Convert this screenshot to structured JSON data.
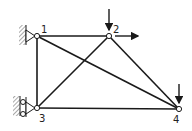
{
  "diagram": {
    "nodes": [
      {
        "id": "1",
        "label": "1",
        "x": 37,
        "y": 36,
        "lx": 41,
        "ly": 33,
        "support": "pin-wall"
      },
      {
        "id": "2",
        "label": "2",
        "x": 109,
        "y": 36,
        "lx": 113,
        "ly": 33,
        "support": "none"
      },
      {
        "id": "3",
        "label": "3",
        "x": 37,
        "y": 108,
        "lx": 39,
        "ly": 122,
        "support": "roller-wall"
      },
      {
        "id": "4",
        "label": "4",
        "x": 179,
        "y": 109,
        "lx": 173,
        "ly": 123,
        "support": "none"
      }
    ],
    "members": [
      {
        "from": "1",
        "to": "2"
      },
      {
        "from": "1",
        "to": "3"
      },
      {
        "from": "1",
        "to": "4"
      },
      {
        "from": "2",
        "to": "3"
      },
      {
        "from": "2",
        "to": "4"
      },
      {
        "from": "3",
        "to": "4"
      }
    ],
    "loads": [
      {
        "node": "2",
        "direction": "down"
      },
      {
        "node": "2",
        "direction": "right"
      },
      {
        "node": "4",
        "direction": "down"
      }
    ],
    "colors": {
      "line": "#1a1a1a",
      "node_fill": "#ffffff",
      "hatch": "#555555"
    }
  }
}
